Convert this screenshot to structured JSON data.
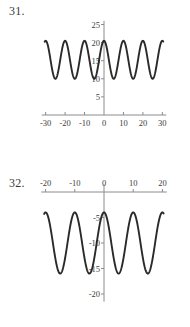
{
  "page": {
    "background_color": "#ffffff",
    "ink_color": "#2a2a2a",
    "axis_color": "#8c8c8c",
    "width": 190,
    "height": 327
  },
  "figures": [
    {
      "number_label": "31.",
      "chart_data": {
        "type": "line",
        "title": "",
        "subtitle": "",
        "xlabel": "",
        "ylabel": "",
        "xlim": [
          -32,
          32
        ],
        "ylim": [
          0,
          26
        ],
        "xticks": [
          -30,
          -20,
          -10,
          0,
          10,
          20,
          30
        ],
        "xticklabels": [
          "-30",
          "-20",
          "-10",
          "0",
          "10",
          "20",
          "30"
        ],
        "yticks": [
          5,
          10,
          15,
          20,
          25
        ],
        "yticklabels": [
          "5",
          "10",
          "15",
          "20",
          "25"
        ],
        "grid": false,
        "legend": "none",
        "axis_position": {
          "x_axis_at_y": 0,
          "y_axis_at_x": 0
        },
        "series": [
          {
            "name": "y",
            "description": "sinusoid oscillating between 10 and 20.5",
            "amplitude": 5.25,
            "midline": 15.25,
            "period": 10,
            "phase_deg": 0,
            "x_start": -30.5,
            "x_end": 30.5,
            "ymin": 10.0,
            "ymax": 20.5,
            "x": [
              -30,
              -27.5,
              -25,
              -22.5,
              -20,
              -17.5,
              -15,
              -12.5,
              -10,
              -7.5,
              -5,
              -2.5,
              0,
              2.5,
              5,
              7.5,
              10,
              12.5,
              15,
              17.5,
              20,
              22.5,
              25,
              27.5,
              30
            ],
            "values": [
              10.0,
              15.25,
              20.5,
              15.25,
              10.0,
              15.25,
              20.5,
              15.25,
              10.0,
              15.25,
              20.5,
              15.25,
              10.0,
              15.25,
              20.5,
              15.25,
              10.0,
              15.25,
              20.5,
              15.25,
              10.0,
              15.25,
              20.5,
              15.25,
              10.0
            ]
          }
        ]
      }
    },
    {
      "number_label": "32.",
      "chart_data": {
        "type": "line",
        "title": "",
        "subtitle": "",
        "xlabel": "",
        "ylabel": "",
        "xlim": [
          -21.5,
          21.5
        ],
        "ylim": [
          -21.5,
          1.5
        ],
        "xticks": [
          -20,
          -10,
          0,
          10,
          20
        ],
        "xticklabels": [
          "-20",
          "-10",
          "0",
          "10",
          "20"
        ],
        "yticks": [
          -5,
          -10,
          -15,
          -20
        ],
        "yticklabels": [
          "-5",
          "-10",
          "-15",
          "-20"
        ],
        "grid": false,
        "legend": "none",
        "axis_position": {
          "x_axis_at_y": 0,
          "y_axis_at_x": 0
        },
        "series": [
          {
            "name": "y",
            "description": "sinusoid oscillating between -16 and -4",
            "amplitude": 6.0,
            "midline": -10.0,
            "period": 10,
            "phase_deg": 0,
            "x_start": -20.5,
            "x_end": 20.5,
            "ymin": -16.0,
            "ymax": -4.0,
            "x": [
              -20,
              -17.5,
              -15,
              -12.5,
              -10,
              -7.5,
              -5,
              -2.5,
              0,
              2.5,
              5,
              7.5,
              10,
              12.5,
              15,
              17.5,
              20
            ],
            "values": [
              -16.0,
              -10.0,
              -4.0,
              -10.0,
              -16.0,
              -10.0,
              -4.0,
              -10.0,
              -16.0,
              -10.0,
              -4.0,
              -10.0,
              -16.0,
              -10.0,
              -4.0,
              -10.0,
              -16.0
            ]
          }
        ]
      }
    }
  ]
}
